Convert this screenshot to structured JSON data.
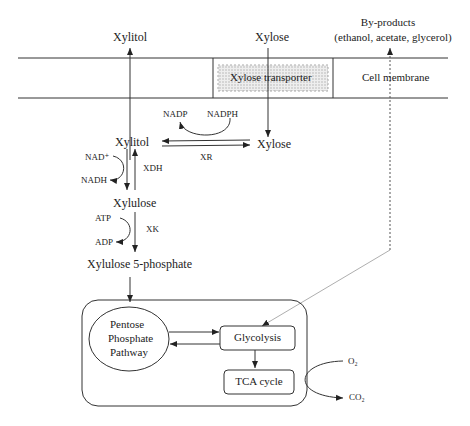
{
  "diagram": {
    "extracellular": {
      "xylitol_out": "Xylitol",
      "xylose_in": "Xylose",
      "byproducts_title": "By-products",
      "byproducts_list": "(ethanol, acetate, glycerol)"
    },
    "membrane": {
      "transporter": "Xylose transporter",
      "label": "Cell membrane"
    },
    "cytosol": {
      "xylose": "Xylose",
      "xylitol": "Xylitol",
      "xylulose": "Xylulose",
      "xylulose5p": "Xylulose 5-phosphate",
      "xr_cofactor_in": "NADPH",
      "xr_cofactor_out": "NADP",
      "xr_enzyme": "XR",
      "xdh_cofactor_in": "NAD⁺",
      "xdh_cofactor_out": "NADH",
      "xdh_enzyme": "XDH",
      "xk_cofactor_in": "ATP",
      "xk_cofactor_out": "ADP",
      "xk_enzyme": "XK"
    },
    "central_metabolism": {
      "ppp_line1": "Pentose",
      "ppp_line2": "Phosphate",
      "ppp_line3": "Pathway",
      "glycolysis": "Glycolysis",
      "tca": "TCA cycle",
      "o2": "O₂",
      "co2": "CO₂"
    },
    "colors": {
      "line": "#333333",
      "transporter_fill": "#d8d8d8",
      "byproduct_line": "#888888"
    }
  }
}
